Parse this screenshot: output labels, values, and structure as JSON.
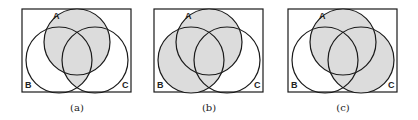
{
  "figure": {
    "shade_color": "#dcdcdc",
    "line_color": "#1a1a1a",
    "panels": [
      {
        "id": "a",
        "caption": "(a)",
        "labels": {
          "A": "A",
          "B": "B",
          "C": "C"
        },
        "shaded_expression": "A ∪ (B ∩ C)",
        "shaded_regions": [
          "A_only",
          "AB_only",
          "AC_only",
          "ABC",
          "BC_only"
        ]
      },
      {
        "id": "b",
        "caption": "(b)",
        "labels": {
          "A": "A",
          "B": "B",
          "C": "C"
        },
        "shaded_expression": "A ∪ B",
        "shaded_regions": [
          "A_only",
          "AB_only",
          "AC_only",
          "ABC",
          "BC_only",
          "B_only"
        ]
      },
      {
        "id": "c",
        "caption": "(c)",
        "labels": {
          "A": "A",
          "B": "B",
          "C": "C"
        },
        "shaded_expression": "A ∪ C",
        "shaded_regions": [
          "A_only",
          "AB_only",
          "AC_only",
          "ABC",
          "BC_only",
          "C_only"
        ]
      }
    ]
  }
}
